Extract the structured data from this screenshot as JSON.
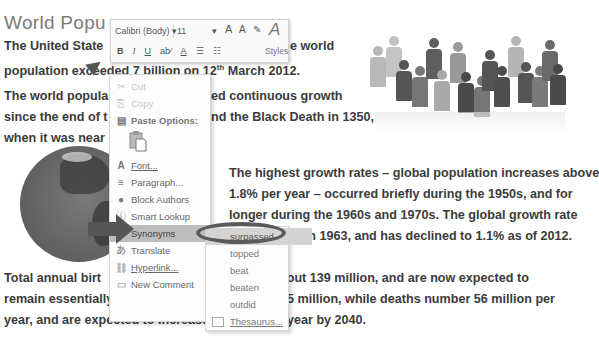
{
  "document": {
    "title": "World Popu",
    "para1": {
      "line1": "The United State",
      "line1_tail": "e world",
      "line2_pre": "population exceeded 7 billion on 12",
      "line2_sup": "th",
      "line2_post": " March 2012."
    },
    "para2": {
      "line1_head": "The world popula",
      "line1_tail": "ed continuous growth",
      "line2_head": "since the end of t",
      "line2_tail": "nd the Black Death in 1350,",
      "line3_head": "when it was near"
    },
    "para3": {
      "line1": "The highest growth rates – global population increases above",
      "line2": "1.8% per year – occurred briefly during the 1950s, and for",
      "line3": "longer during the 1960s and 1970s. The global growth rate",
      "line4_tail": "% in 1963, and has declined to 1.1% as of 2012."
    },
    "para4": {
      "line1_head": "Total annual birt",
      "line1_tail": "about 139 million, and are now expected to",
      "line2_head": "remain essentially constant at their",
      "line2_tail": "5 million, while deaths number 56 million per",
      "line3_head": "year, and are expected to increase t",
      "line3_tail": "year by 2040."
    }
  },
  "mini_toolbar": {
    "font_name": "Calibri (Body)",
    "font_size": "11",
    "dropdown_arrow": "▾",
    "grow_font": "A",
    "shrink_font": "A",
    "bold": "B",
    "italic": "I",
    "underline": "U",
    "highlight": "ab⁄",
    "font_color": "A",
    "bullets": "☰",
    "numbering": "☷",
    "styles_label": "Styles",
    "styles_icon": "A"
  },
  "context_menu": {
    "items": [
      {
        "label": "Cut",
        "icon": "✂",
        "disabled": true
      },
      {
        "label": "Copy",
        "icon": "⎘",
        "disabled": true
      },
      {
        "label": "Paste Options:",
        "icon": "📋"
      },
      {
        "label": "Font...",
        "icon": "A"
      },
      {
        "label": "Paragraph...",
        "icon": "≡"
      },
      {
        "label": "Block Authors",
        "icon": "👤"
      },
      {
        "label": "Smart Lookup",
        "icon": "ⓘ"
      },
      {
        "label": "Synonyms",
        "icon": ""
      },
      {
        "label": "Translate",
        "icon": "あ"
      },
      {
        "label": "Hyperlink...",
        "icon": "🔗"
      },
      {
        "label": "New Comment",
        "icon": "💬"
      }
    ]
  },
  "synonyms_submenu": {
    "items": [
      "surpassed",
      "topped",
      "beat",
      "beaten",
      "outdid"
    ],
    "thesaurus": "Thesaurus..."
  },
  "colors": {
    "menu_highlight": "#bdbdbd",
    "ellipse": "#5a5a5a",
    "arrow": "#555555"
  }
}
